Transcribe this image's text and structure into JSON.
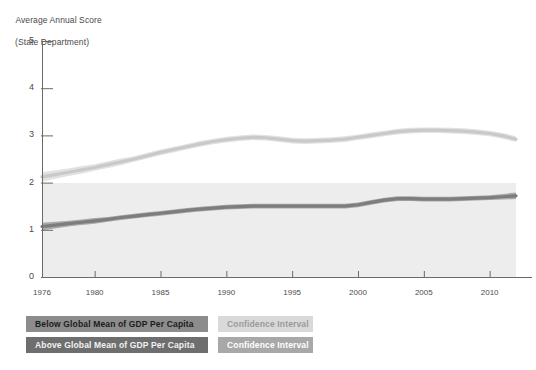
{
  "chart_data": {
    "type": "line",
    "title": "Average Annual Score",
    "subtitle": "(State Department)",
    "ylabel": "Average Annual Score (State Department)",
    "xlabel": "",
    "ylim": [
      0,
      5
    ],
    "xlim": [
      1976,
      2012
    ],
    "grid": false,
    "legend_position": "below-plot",
    "yticks": [
      0,
      1,
      2,
      3,
      4,
      5
    ],
    "xticks": [
      1976,
      1980,
      1985,
      1990,
      1995,
      2000,
      2005,
      2010
    ],
    "x": [
      1976,
      1977,
      1978,
      1979,
      1980,
      1981,
      1982,
      1983,
      1984,
      1985,
      1986,
      1987,
      1988,
      1989,
      1990,
      1991,
      1992,
      1993,
      1994,
      1995,
      1996,
      1997,
      1998,
      1999,
      2000,
      2001,
      2002,
      2003,
      2004,
      2005,
      2006,
      2007,
      2008,
      2009,
      2010,
      2011,
      2012
    ],
    "series": [
      {
        "name": "Below Global Mean of GDP Per Capita",
        "color": "#c9c9c9",
        "ci_color": "#e2e2e2",
        "values": [
          2.12,
          2.17,
          2.22,
          2.27,
          2.32,
          2.38,
          2.44,
          2.5,
          2.57,
          2.64,
          2.7,
          2.76,
          2.82,
          2.87,
          2.91,
          2.94,
          2.96,
          2.95,
          2.92,
          2.89,
          2.88,
          2.89,
          2.9,
          2.92,
          2.96,
          3.0,
          3.04,
          3.08,
          3.1,
          3.11,
          3.11,
          3.1,
          3.09,
          3.07,
          3.04,
          2.99,
          2.92
        ],
        "ci_lower": [
          2.02,
          2.08,
          2.14,
          2.19,
          2.25,
          2.31,
          2.37,
          2.44,
          2.51,
          2.58,
          2.64,
          2.7,
          2.76,
          2.81,
          2.85,
          2.88,
          2.9,
          2.89,
          2.86,
          2.83,
          2.82,
          2.83,
          2.84,
          2.86,
          2.9,
          2.94,
          2.98,
          3.02,
          3.04,
          3.05,
          3.05,
          3.04,
          3.03,
          3.01,
          2.98,
          2.93,
          2.86
        ],
        "ci_upper": [
          2.22,
          2.26,
          2.3,
          2.35,
          2.39,
          2.45,
          2.51,
          2.56,
          2.63,
          2.7,
          2.76,
          2.82,
          2.88,
          2.93,
          2.97,
          3.0,
          3.02,
          3.01,
          2.98,
          2.95,
          2.94,
          2.95,
          2.96,
          2.98,
          3.02,
          3.06,
          3.1,
          3.14,
          3.16,
          3.17,
          3.17,
          3.16,
          3.15,
          3.13,
          3.1,
          3.05,
          2.98
        ]
      },
      {
        "name": "Above Global Mean of GDP Per Capita",
        "color": "#7d7d7d",
        "ci_color": "#a9a9a9",
        "values": [
          1.07,
          1.1,
          1.13,
          1.16,
          1.19,
          1.22,
          1.26,
          1.29,
          1.32,
          1.35,
          1.38,
          1.41,
          1.44,
          1.46,
          1.48,
          1.49,
          1.5,
          1.5,
          1.5,
          1.5,
          1.5,
          1.5,
          1.5,
          1.5,
          1.53,
          1.58,
          1.63,
          1.66,
          1.66,
          1.65,
          1.65,
          1.65,
          1.66,
          1.67,
          1.68,
          1.7,
          1.72
        ],
        "ci_lower": [
          0.99,
          1.03,
          1.07,
          1.1,
          1.13,
          1.17,
          1.21,
          1.24,
          1.27,
          1.3,
          1.33,
          1.36,
          1.39,
          1.41,
          1.43,
          1.44,
          1.45,
          1.45,
          1.45,
          1.45,
          1.45,
          1.45,
          1.45,
          1.45,
          1.48,
          1.53,
          1.58,
          1.61,
          1.61,
          1.6,
          1.6,
          1.6,
          1.61,
          1.62,
          1.63,
          1.64,
          1.65
        ],
        "ci_upper": [
          1.15,
          1.17,
          1.19,
          1.22,
          1.25,
          1.27,
          1.31,
          1.34,
          1.37,
          1.4,
          1.43,
          1.46,
          1.49,
          1.51,
          1.53,
          1.54,
          1.55,
          1.55,
          1.55,
          1.55,
          1.55,
          1.55,
          1.55,
          1.55,
          1.58,
          1.63,
          1.68,
          1.71,
          1.71,
          1.7,
          1.7,
          1.7,
          1.71,
          1.72,
          1.73,
          1.76,
          1.79
        ]
      }
    ]
  },
  "axis": {
    "title_line1": "Average Annual Score",
    "title_line2": "(State Department)",
    "ytick_labels": [
      "5",
      "4",
      "3",
      "2",
      "1",
      "0"
    ],
    "xtick_labels": [
      "1976",
      "1980",
      "1985",
      "1990",
      "1995",
      "2000",
      "2005",
      "2010"
    ]
  },
  "legend": {
    "items": [
      {
        "label": "Below Global Mean of GDP Per Capita",
        "ci_label": "Confidence Interval"
      },
      {
        "label": "Above Global Mean of GDP Per Capita",
        "ci_label": "Confidence Interval"
      }
    ]
  }
}
